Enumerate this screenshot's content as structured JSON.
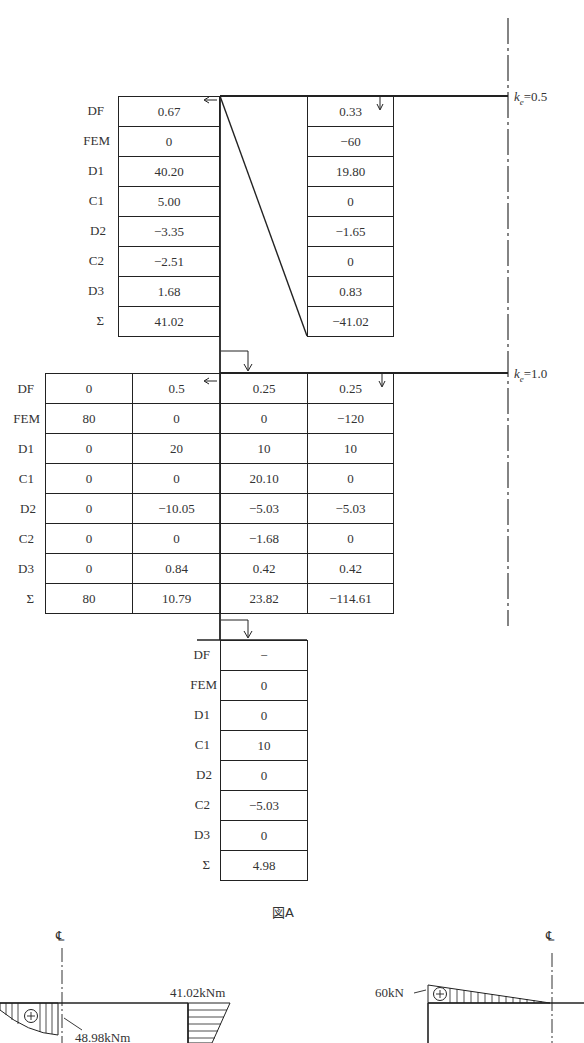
{
  "figure": {
    "caption": "図A",
    "row_labels": [
      "DF",
      "FEM",
      "D1",
      "C1",
      "D2",
      "C2",
      "D3",
      "Σ"
    ],
    "top_joint": {
      "stiffness_label_k": "k",
      "stiffness_label_sub": "e",
      "stiffness_label_value": "=0.5",
      "columns": [
        {
          "values": [
            "0.67",
            "0",
            "40.20",
            "5.00",
            "−3.35",
            "−2.51",
            "1.68",
            "41.02"
          ]
        },
        {
          "values": [
            "0.33",
            "−60",
            "19.80",
            "0",
            "−1.65",
            "0",
            "0.83",
            "−41.02"
          ]
        }
      ]
    },
    "middle_joint": {
      "stiffness_label_k": "k",
      "stiffness_label_sub": "e",
      "stiffness_label_value": "=1.0",
      "columns": [
        {
          "values": [
            "0",
            "80",
            "0",
            "0",
            "0",
            "0",
            "0",
            "80"
          ]
        },
        {
          "values": [
            "0.5",
            "0",
            "20",
            "0",
            "−10.05",
            "0",
            "0.84",
            "10.79"
          ]
        },
        {
          "values": [
            "0.25",
            "0",
            "10",
            "20.10",
            "−5.03",
            "−1.68",
            "0.42",
            "23.82"
          ]
        },
        {
          "values": [
            "0.25",
            "−120",
            "10",
            "0",
            "−5.03",
            "0",
            "0.42",
            "−114.61"
          ]
        }
      ]
    },
    "bottom_joint": {
      "columns": [
        {
          "values": [
            "−",
            "0",
            "0",
            "10",
            "0",
            "−5.03",
            "0",
            "4.98"
          ]
        }
      ]
    }
  },
  "moment_diagram": {
    "centerline_label": "℄",
    "plus_symbol": "+",
    "label_end_moment": "41.02kNm",
    "label_mid_moment": "48.98kNm"
  },
  "shear_diagram": {
    "centerline_label": "℄",
    "plus_symbol": "+",
    "label_shear": "60kN"
  }
}
